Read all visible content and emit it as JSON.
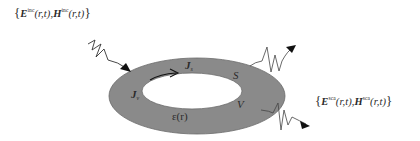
{
  "diagram": {
    "incident_field": {
      "open_brace": "{",
      "e_symbol": "E",
      "e_superscript": "inc",
      "h_symbol": "H",
      "h_superscript": "inc",
      "args": "(r,t)",
      "separator": ",",
      "close_brace": "}"
    },
    "scattered_field": {
      "open_brace": "{",
      "e_symbol": "E",
      "e_superscript": "sca",
      "h_symbol": "H",
      "h_superscript": "sca",
      "args": "(r,t)",
      "separator": ",",
      "close_brace": "}"
    },
    "labels": {
      "surface_current_symbol": "J",
      "surface_current_subscript": "s",
      "volume_current_symbol": "J",
      "volume_current_subscript": "v",
      "surface": "S",
      "volume": "V",
      "permittivity": "ε(r)"
    },
    "colors": {
      "body_fill": "#8a8a8a",
      "body_stroke": "#5e5e5e",
      "hole_fill": "#ffffff",
      "wave_stroke": "#3a3a3a",
      "arrow_fill": "#111111"
    }
  }
}
